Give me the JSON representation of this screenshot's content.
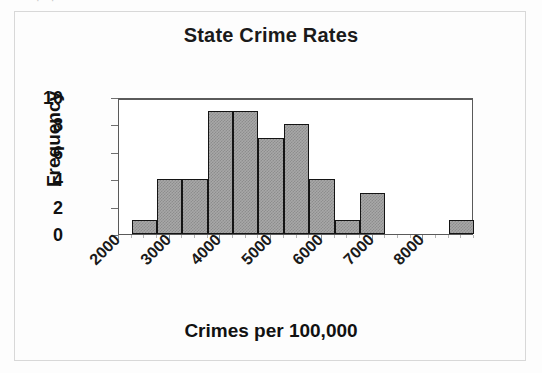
{
  "figure": {
    "scan_artifact_text": "· ·",
    "background": "#ffffff",
    "frame_color": "#d8d8d8"
  },
  "chart_data": {
    "type": "bar",
    "title": "State Crime Rates",
    "xlabel": "Crimes per 100,000",
    "ylabel": "Frequency",
    "bin_width": 500,
    "bin_starts": [
      2250,
      2750,
      3250,
      3750,
      4250,
      4750,
      5250,
      5750,
      6250,
      6750,
      8500
    ],
    "categories": [
      "2250",
      "2750",
      "3250",
      "3750",
      "4250",
      "4750",
      "5250",
      "5750",
      "6250",
      "6750",
      "8500"
    ],
    "values": [
      1,
      4,
      4,
      9,
      9,
      7,
      8,
      4,
      1,
      3,
      1
    ],
    "xlim": [
      2000,
      9000
    ],
    "ylim": [
      0,
      10
    ],
    "x_tick_labels": [
      "2000",
      "3000",
      "4000",
      "5000",
      "6000",
      "7000",
      "8000"
    ],
    "x_tick_values": [
      2000,
      3000,
      4000,
      5000,
      6000,
      7000,
      8000
    ],
    "y_tick_labels": [
      "0",
      "2",
      "4",
      "6",
      "8",
      "10"
    ],
    "y_tick_values": [
      0,
      2,
      4,
      6,
      8,
      10
    ],
    "grid": false,
    "legend": false,
    "bar_fill_color": "#a8a8a8",
    "bar_edge_color": "#141414",
    "axis_color": "#5a5a5a"
  }
}
